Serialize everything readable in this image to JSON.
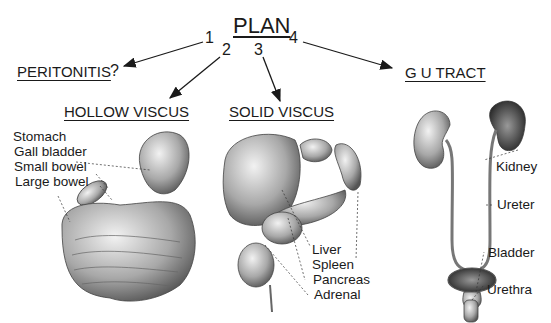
{
  "diagram": {
    "title": "PLAN",
    "branches": [
      {
        "number": "1",
        "label": "PERITONITIS",
        "suffix": "?"
      },
      {
        "number": "2",
        "label": "HOLLOW VISCUS"
      },
      {
        "number": "3",
        "label": "SOLID VISCUS"
      },
      {
        "number": "4",
        "label": "G U TRACT"
      }
    ],
    "hollow_viscus_labels": [
      "Stomach",
      "Gall bladder",
      "Small bowel",
      "Large bowel"
    ],
    "solid_viscus_labels": [
      "Liver",
      "Spleen",
      "Pancreas",
      "Adrenal"
    ],
    "gu_tract_labels": [
      "Kidney",
      "Ureter",
      "Bladder",
      "Urethra"
    ]
  }
}
